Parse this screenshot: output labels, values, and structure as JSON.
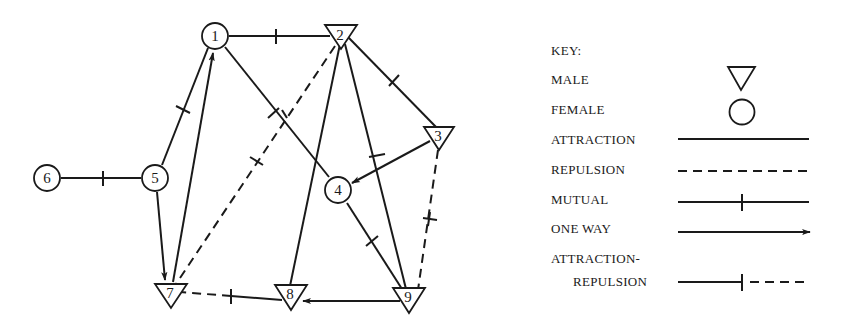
{
  "colors": {
    "ink": "#1a1a1a",
    "background": "#ffffff"
  },
  "nodes": [
    {
      "id": "1",
      "label": "1",
      "gender": "female",
      "x": 215,
      "y": 36
    },
    {
      "id": "2",
      "label": "2",
      "gender": "male",
      "x": 340,
      "y": 36
    },
    {
      "id": "3",
      "label": "3",
      "gender": "male",
      "x": 438,
      "y": 135
    },
    {
      "id": "4",
      "label": "4",
      "gender": "female",
      "x": 338,
      "y": 190
    },
    {
      "id": "5",
      "label": "5",
      "gender": "female",
      "x": 155,
      "y": 178
    },
    {
      "id": "6",
      "label": "6",
      "gender": "female",
      "x": 47,
      "y": 178
    },
    {
      "id": "7",
      "label": "7",
      "gender": "male",
      "x": 170,
      "y": 292
    },
    {
      "id": "8",
      "label": "8",
      "gender": "male",
      "x": 290,
      "y": 294
    },
    {
      "id": "9",
      "label": "9",
      "gender": "male",
      "x": 408,
      "y": 296
    }
  ],
  "edges": [
    {
      "from": "1",
      "to": "2",
      "type": "attraction",
      "direction": "mutual"
    },
    {
      "from": "1",
      "to": "5",
      "type": "attraction",
      "direction": "mutual"
    },
    {
      "from": "7",
      "to": "1",
      "type": "attraction",
      "direction": "one-way"
    },
    {
      "from": "1",
      "to": "4",
      "type": "attraction",
      "direction": "mutual"
    },
    {
      "from": "2",
      "to": "7",
      "type": "repulsion",
      "direction": "mutual"
    },
    {
      "from": "2",
      "to": "3",
      "type": "attraction",
      "direction": "mutual"
    },
    {
      "from": "2",
      "to": "8",
      "type": "attraction",
      "direction": "one-way-undirected"
    },
    {
      "from": "2",
      "to": "9",
      "type": "attraction",
      "direction": "mutual"
    },
    {
      "from": "3",
      "to": "4",
      "type": "attraction",
      "direction": "one-way"
    },
    {
      "from": "3",
      "to": "9",
      "type": "repulsion",
      "direction": "mutual"
    },
    {
      "from": "4",
      "to": "9",
      "type": "attraction",
      "direction": "mutual"
    },
    {
      "from": "6",
      "to": "5",
      "type": "attraction",
      "direction": "mutual"
    },
    {
      "from": "5",
      "to": "7",
      "type": "attraction",
      "direction": "one-way"
    },
    {
      "from": "9",
      "to": "8",
      "type": "attraction",
      "direction": "one-way"
    },
    {
      "from": "8",
      "to": "7",
      "type": "attraction-repulsion",
      "direction": "mutual"
    }
  ],
  "key": {
    "heading": "KEY:",
    "items": [
      {
        "label": "MALE",
        "symbol": "triangle"
      },
      {
        "label": "FEMALE",
        "symbol": "circle"
      },
      {
        "label": "ATTRACTION",
        "symbol": "solid-line"
      },
      {
        "label": "REPULSION",
        "symbol": "dashed-line"
      },
      {
        "label": "MUTUAL",
        "symbol": "tick-line"
      },
      {
        "label": "ONE WAY",
        "symbol": "arrow-line"
      },
      {
        "label": "ATTRACTION-",
        "label2": "REPULSION",
        "symbol": "solid-tick-dashed-line"
      }
    ]
  }
}
